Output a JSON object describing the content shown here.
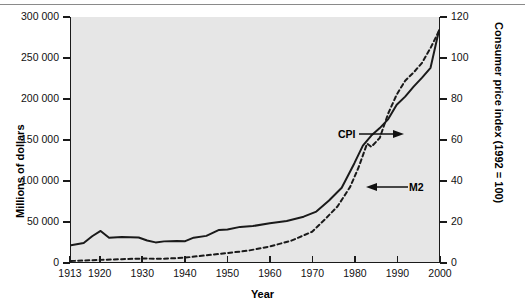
{
  "chart_data": {
    "type": "line",
    "title": "",
    "xlabel": "Year",
    "ylabel": "Millions of dollars",
    "y2label": "Consumer price index (1992 = 100)",
    "xlim": [
      1913,
      2000
    ],
    "ylim": [
      0,
      300000
    ],
    "y2lim": [
      0,
      120
    ],
    "grid": false,
    "legend_position": "inline-annotations",
    "x_ticks": [
      1913,
      1920,
      1930,
      1940,
      1950,
      1960,
      1970,
      1980,
      1990,
      2000
    ],
    "x_tick_labels": [
      "1913",
      "1920",
      "1930",
      "1940",
      "1950",
      "1960",
      "1970",
      "1980",
      "1990",
      "2000"
    ],
    "y_ticks": [
      0,
      50000,
      100000,
      150000,
      200000,
      250000,
      300000
    ],
    "y_tick_labels": [
      "0",
      "50 000",
      "100 000",
      "150 000",
      "200 000",
      "250 000",
      "300 000"
    ],
    "y2_ticks": [
      0,
      20,
      40,
      60,
      80,
      100,
      120
    ],
    "y2_tick_labels": [
      "0",
      "20",
      "40",
      "60",
      "80",
      "100",
      "120"
    ],
    "series": [
      {
        "name": "CPI",
        "axis": "right",
        "style": "solid",
        "color": "#1a1a1a",
        "label": "CPI",
        "x": [
          1913,
          1916,
          1918,
          1920,
          1922,
          1925,
          1929,
          1931,
          1933,
          1935,
          1938,
          1940,
          1942,
          1945,
          1948,
          1950,
          1953,
          1956,
          1960,
          1964,
          1968,
          1971,
          1974,
          1977,
          1980,
          1982,
          1984,
          1986,
          1988,
          1990,
          1992,
          1994,
          1996,
          1998,
          2000
        ],
        "values": [
          8.2,
          9.3,
          12.6,
          15.2,
          11.9,
          12.2,
          12.0,
          10.5,
          9.6,
          10.1,
          10.3,
          10.2,
          11.9,
          12.8,
          15.7,
          15.9,
          17.2,
          17.6,
          19.0,
          20.1,
          22.2,
          24.7,
          30.1,
          36.4,
          48.4,
          57.0,
          61.9,
          65.6,
          70.0,
          77.0,
          81.0,
          85.9,
          90.3,
          95.1,
          113.5
        ]
      },
      {
        "name": "M2",
        "axis": "left",
        "style": "dashed",
        "color": "#1a1a1a",
        "label": "M2",
        "x": [
          1913,
          1920,
          1925,
          1930,
          1935,
          1940,
          1945,
          1950,
          1955,
          1960,
          1965,
          1970,
          1973,
          1976,
          1979,
          1981,
          1983,
          1984,
          1986,
          1988,
          1990,
          1992,
          1994,
          1996,
          1998,
          2000
        ],
        "values": [
          1200,
          2600,
          3500,
          4200,
          4000,
          5400,
          8200,
          11000,
          14000,
          19000,
          26000,
          37000,
          52000,
          68000,
          92000,
          116000,
          145000,
          141000,
          152000,
          182000,
          205000,
          222000,
          232000,
          244000,
          262000,
          283000
        ]
      }
    ],
    "annotations": [
      {
        "text": "CPI",
        "target_series": "CPI",
        "arrow_direction": "right"
      },
      {
        "text": "M2",
        "target_series": "M2",
        "arrow_direction": "left"
      }
    ]
  },
  "axes": {
    "left_title": "Millions of dollars",
    "right_title": "Consumer price index (1992 = 100)",
    "bottom_title": "Year"
  },
  "colors": {
    "plot_background": "#e6e6e6",
    "page_background": "#ffffff",
    "line": "#1a1a1a",
    "axis": "#1a1a1a",
    "rule": "#8a8a8a"
  }
}
